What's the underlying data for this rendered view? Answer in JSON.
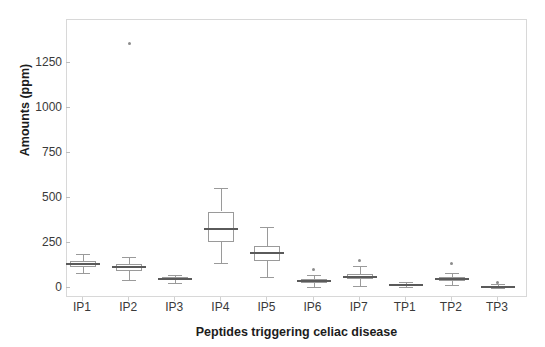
{
  "chart_data": {
    "type": "box",
    "title": "",
    "xlabel": "Peptides triggering celiac disease",
    "ylabel": "Amounts (ppm)",
    "ylim": [
      -70,
      1450
    ],
    "yticks": [
      0,
      250,
      500,
      750,
      1000,
      1250
    ],
    "ytick_labels": [
      "0",
      "250",
      "500",
      "750",
      "1000",
      "1250"
    ],
    "grid": false,
    "legend": "none",
    "categories": [
      "IP1",
      "IP2",
      "IP3",
      "IP4",
      "IP5",
      "IP6",
      "IP7",
      "TP1",
      "TP2",
      "TP3"
    ],
    "boxes": [
      {
        "name": "IP1",
        "whisker_low": 85,
        "q1": 115,
        "median": 133,
        "q3": 148,
        "whisker_high": 190,
        "outliers": []
      },
      {
        "name": "IP2",
        "whisker_low": 45,
        "q1": 95,
        "median": 115,
        "q3": 135,
        "whisker_high": 170,
        "outliers": [
          1360
        ]
      },
      {
        "name": "IP3",
        "whisker_low": 30,
        "q1": 45,
        "median": 52,
        "q3": 62,
        "whisker_high": 75,
        "outliers": []
      },
      {
        "name": "IP4",
        "whisker_low": 140,
        "q1": 255,
        "median": 330,
        "q3": 425,
        "whisker_high": 558,
        "outliers": []
      },
      {
        "name": "IP5",
        "whisker_low": 62,
        "q1": 152,
        "median": 196,
        "q3": 235,
        "whisker_high": 340,
        "outliers": []
      },
      {
        "name": "IP6",
        "whisker_low": 5,
        "q1": 28,
        "median": 40,
        "q3": 52,
        "whisker_high": 72,
        "outliers": [
          105
        ]
      },
      {
        "name": "IP7",
        "whisker_low": 10,
        "q1": 48,
        "median": 62,
        "q3": 80,
        "whisker_high": 120,
        "outliers": [
          152
        ]
      },
      {
        "name": "TP1",
        "whisker_low": 8,
        "q1": 14,
        "median": 19,
        "q3": 24,
        "whisker_high": 32,
        "outliers": []
      },
      {
        "name": "TP2",
        "whisker_low": 18,
        "q1": 38,
        "median": 50,
        "q3": 60,
        "whisker_high": 85,
        "outliers": [
          135
        ]
      },
      {
        "name": "TP3",
        "whisker_low": 0,
        "q1": 4,
        "median": 8,
        "q3": 13,
        "whisker_high": 22,
        "outliers": [
          30
        ]
      }
    ],
    "colors": {
      "box_edge": "#9a9a9a",
      "median": "#5a5a5a",
      "whisker": "#9a9a9a",
      "outlier": "#8c8c8c",
      "frame": "#d8d8d8",
      "tick_text": "#3a3a3a",
      "axis_label_text": "#1c1c1c",
      "background": "#ffffff"
    }
  }
}
